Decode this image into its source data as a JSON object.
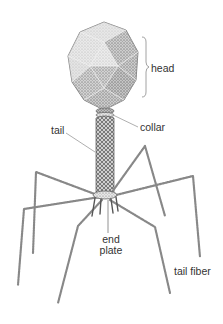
{
  "diagram": {
    "colors": {
      "ink": "#4a4a4a",
      "shade_light": "#d9d9d9",
      "shade_mid": "#b5b5b5",
      "shade_dark": "#8a8a8a",
      "leader_line": "#9a9a9a",
      "label_text": "#333333",
      "background": "#ffffff"
    },
    "labels": {
      "head": "head",
      "collar": "collar",
      "tail": "tail",
      "end_plate_line1": "end",
      "end_plate_line2": "plate",
      "tail_fiber": "tail fiber"
    },
    "parts": [
      {
        "id": "head",
        "shape": "icosahedron"
      },
      {
        "id": "collar",
        "shape": "ring"
      },
      {
        "id": "tail",
        "shape": "cylinder"
      },
      {
        "id": "end_plate",
        "shape": "hexagonal plate"
      },
      {
        "id": "tail_fiber",
        "shape": "jointed fibers",
        "count": 6
      }
    ]
  }
}
